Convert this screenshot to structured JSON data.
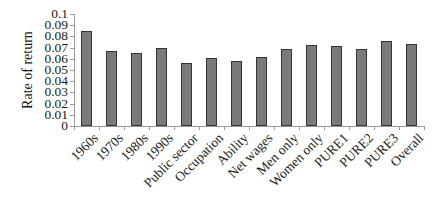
{
  "chart_data": {
    "type": "bar",
    "title": "",
    "xlabel": "",
    "ylabel": "Rate of return",
    "ylim": [
      0,
      0.1
    ],
    "yticks": [
      "0",
      "0.01",
      "0.02",
      "0.03",
      "0.04",
      "0.05",
      "0.06",
      "0.07",
      "0.08",
      "0.09",
      "0.1"
    ],
    "grid": false,
    "legend": null,
    "categories": [
      "1960s",
      "1970s",
      "1980s",
      "1990s",
      "Public sector",
      "Occupation",
      "Ability",
      "Net wages",
      "Men only",
      "Women only",
      "PURE1",
      "PURE2",
      "PURE3",
      "Overall"
    ],
    "values": [
      0.085,
      0.067,
      0.065,
      0.07,
      0.056,
      0.061,
      0.058,
      0.062,
      0.069,
      0.072,
      0.071,
      0.069,
      0.076,
      0.073
    ],
    "colors": {
      "bar_fill": "#7a7a7a",
      "bar_border": "#333333",
      "axis": "#9a9a9a"
    }
  }
}
